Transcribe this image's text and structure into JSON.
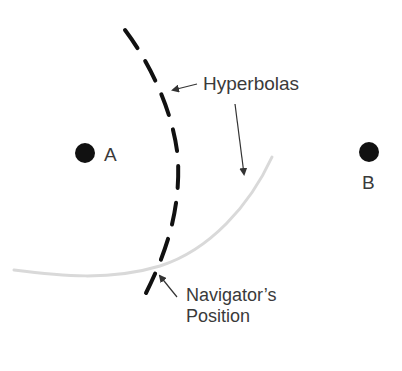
{
  "diagram": {
    "colors": {
      "background": "#ffffff",
      "station_dot": "#111111",
      "dashed_hyperbola": "#111111",
      "faint_hyperbola": "#d9d9d9",
      "arrow": "#333333",
      "label_text": "#3a3a3a"
    },
    "stations": [
      {
        "id": "A",
        "label": "A",
        "cx": 85,
        "cy": 153,
        "r": 10
      },
      {
        "id": "B",
        "label": "B",
        "cx": 369,
        "cy": 152,
        "r": 10
      }
    ],
    "labels": {
      "hyperbolas": "Hyperbolas",
      "navigator_line1": "Navigator’s",
      "navigator_line2": "Position"
    },
    "curves": [
      {
        "name": "dashed-hyperbola",
        "style": "dashed",
        "stroke_width": 4
      },
      {
        "name": "faint-hyperbola",
        "style": "solid-light",
        "stroke_width": 3
      }
    ],
    "annotations": [
      {
        "name": "hyperbolas-arrow-to-dashed",
        "points_to": "dashed-hyperbola"
      },
      {
        "name": "hyperbolas-arrow-to-faint",
        "points_to": "faint-hyperbola"
      },
      {
        "name": "navigator-arrow",
        "points_to": "intersection"
      }
    ]
  }
}
